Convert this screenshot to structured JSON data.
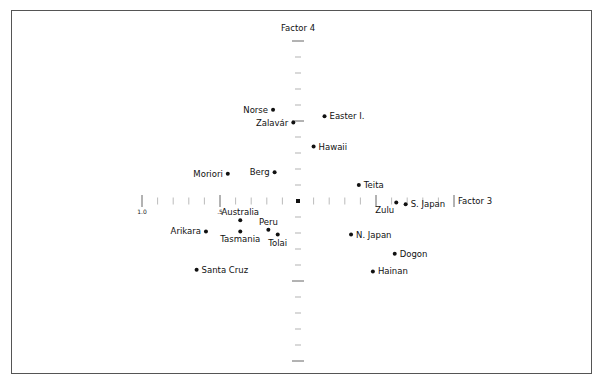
{
  "chart_data": {
    "type": "scatter",
    "title": "",
    "xlabel": "Factor 3",
    "ylabel": "Factor 4",
    "xlim": [
      -1.0,
      1.0
    ],
    "ylim": [
      -1.0,
      1.0
    ],
    "x_tick_step": 0.1,
    "y_tick_step": 0.1,
    "x_tick_labels": [
      {
        "value": -1.0,
        "label": "1.0"
      },
      {
        "value": -0.5,
        "label": ".5"
      }
    ],
    "grid": false,
    "legend": "none",
    "points": [
      {
        "name": "Norse",
        "x": -0.16,
        "y": 0.57,
        "label_side": "left"
      },
      {
        "name": "Zalavár",
        "x": -0.03,
        "y": 0.49,
        "label_side": "left"
      },
      {
        "name": "Easter I.",
        "x": 0.17,
        "y": 0.53,
        "label_side": "right"
      },
      {
        "name": "Hawaii",
        "x": 0.1,
        "y": 0.34,
        "label_side": "right"
      },
      {
        "name": "Berg",
        "x": -0.15,
        "y": 0.18,
        "label_side": "left"
      },
      {
        "name": "Moriori",
        "x": -0.45,
        "y": 0.17,
        "label_side": "left"
      },
      {
        "name": "Teita",
        "x": 0.39,
        "y": 0.1,
        "label_side": "right"
      },
      {
        "name": "Zulu",
        "x": 0.63,
        "y": -0.01,
        "label_side": "below-left"
      },
      {
        "name": "S. Japan",
        "x": 0.69,
        "y": -0.02,
        "label_side": "right"
      },
      {
        "name": "Australia",
        "x": -0.37,
        "y": -0.12,
        "label_side": "above"
      },
      {
        "name": "Peru",
        "x": -0.19,
        "y": -0.18,
        "label_side": "above"
      },
      {
        "name": "Tasmania",
        "x": -0.37,
        "y": -0.19,
        "label_side": "below"
      },
      {
        "name": "Tolai",
        "x": -0.13,
        "y": -0.21,
        "label_side": "below"
      },
      {
        "name": "Arikara",
        "x": -0.59,
        "y": -0.19,
        "label_side": "left"
      },
      {
        "name": "N. Japan",
        "x": 0.34,
        "y": -0.21,
        "label_side": "right"
      },
      {
        "name": "Dogon",
        "x": 0.62,
        "y": -0.33,
        "label_side": "right"
      },
      {
        "name": "Hainan",
        "x": 0.48,
        "y": -0.44,
        "label_side": "right"
      },
      {
        "name": "Santa Cruz",
        "x": -0.65,
        "y": -0.43,
        "label_side": "right"
      }
    ]
  }
}
